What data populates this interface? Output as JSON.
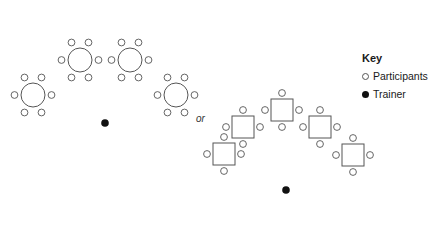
{
  "diagram": {
    "separator_label": "or",
    "key": {
      "title": "Key",
      "items": [
        {
          "label": "Participants",
          "symbol": "open-circle"
        },
        {
          "label": "Trainer",
          "symbol": "filled-circle"
        }
      ]
    },
    "layouts": [
      {
        "name": "round-tables-horseshoe",
        "tables": [
          {
            "shape": "circle",
            "cx": 33,
            "cy": 95,
            "seats": 6
          },
          {
            "shape": "circle",
            "cx": 80,
            "cy": 60,
            "seats": 6
          },
          {
            "shape": "circle",
            "cx": 130,
            "cy": 60,
            "seats": 6
          },
          {
            "shape": "circle",
            "cx": 176,
            "cy": 95,
            "seats": 6
          }
        ],
        "trainer": {
          "x": 105,
          "y": 123
        }
      },
      {
        "name": "square-tables-chevron",
        "tables": [
          {
            "shape": "square",
            "cx": 224,
            "cy": 154,
            "seats": 4
          },
          {
            "shape": "square",
            "cx": 243,
            "cy": 127,
            "seats": 4
          },
          {
            "shape": "square",
            "cx": 282,
            "cy": 110,
            "seats": 4
          },
          {
            "shape": "square",
            "cx": 320,
            "cy": 127,
            "seats": 4
          },
          {
            "shape": "square",
            "cx": 353,
            "cy": 155,
            "seats": 4
          }
        ],
        "trainer": {
          "x": 286,
          "y": 190
        }
      }
    ],
    "colors": {
      "stroke": "#555555",
      "trainer": "#111111"
    }
  }
}
